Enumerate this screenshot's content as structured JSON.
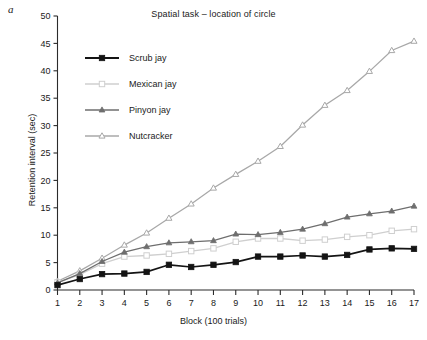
{
  "panel": {
    "label": "a"
  },
  "chart_data": {
    "type": "line",
    "title": "Spatial task – location of circle",
    "xlabel": "Block (100 trials)",
    "ylabel": "Retention interval (sec)",
    "x": [
      1,
      2,
      3,
      4,
      5,
      6,
      7,
      8,
      9,
      10,
      11,
      12,
      13,
      14,
      15,
      16,
      17
    ],
    "xticklabels": [
      "1",
      "2",
      "3",
      "4",
      "5",
      "6",
      "7",
      "8",
      "9",
      "10",
      "11",
      "12",
      "13",
      "14",
      "15",
      "16",
      "17"
    ],
    "yticks": [
      0,
      5,
      10,
      15,
      20,
      25,
      30,
      35,
      40,
      45,
      50
    ],
    "yticklabels": [
      "0",
      "5",
      "10",
      "15",
      "20",
      "25",
      "30",
      "35",
      "40",
      "45",
      "50"
    ],
    "xlim": [
      1,
      17
    ],
    "ylim": [
      0,
      50
    ],
    "grid": false,
    "legend_position": "upper left",
    "series": [
      {
        "name": "Scrub jay",
        "marker": "filled-square",
        "color": "#141414",
        "values": [
          0.9,
          2.0,
          2.9,
          3.0,
          3.3,
          4.6,
          4.2,
          4.6,
          5.1,
          6.1,
          6.1,
          6.3,
          6.1,
          6.4,
          7.4,
          7.6,
          7.5
        ]
      },
      {
        "name": "Mexican jay",
        "marker": "open-square",
        "color": "#cfcfcf",
        "values": [
          1.4,
          2.8,
          4.8,
          6.1,
          6.3,
          6.6,
          7.1,
          7.6,
          8.8,
          9.4,
          9.4,
          9.0,
          9.2,
          9.7,
          10.0,
          10.8,
          11.1
        ]
      },
      {
        "name": "Pinyon jay",
        "marker": "filled-triangle",
        "color": "#6e6e6e",
        "values": [
          1.3,
          3.0,
          5.2,
          6.9,
          7.9,
          8.6,
          8.8,
          9.0,
          10.2,
          10.1,
          10.5,
          11.1,
          12.1,
          13.3,
          13.9,
          14.4,
          15.3
        ]
      },
      {
        "name": "Nutcracker",
        "marker": "open-triangle",
        "color": "#a8a8a8",
        "values": [
          1.6,
          3.5,
          5.8,
          8.2,
          10.4,
          13.1,
          15.7,
          18.6,
          21.1,
          23.5,
          26.2,
          30.1,
          33.7,
          36.4,
          39.9,
          43.7,
          45.4
        ]
      }
    ]
  }
}
